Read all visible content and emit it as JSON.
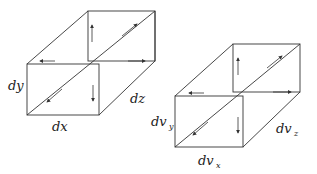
{
  "diagram": {
    "left_box": {
      "labels": {
        "height": "dy",
        "width": "dx",
        "depth": "dz"
      }
    },
    "right_box": {
      "labels": {
        "height_main": "dv",
        "height_sub": "y",
        "width_main": "dv",
        "width_sub": "x",
        "depth_main": "dv",
        "depth_sub": "z"
      }
    },
    "colors": {
      "stroke": "#333333",
      "background": "#ffffff"
    }
  }
}
